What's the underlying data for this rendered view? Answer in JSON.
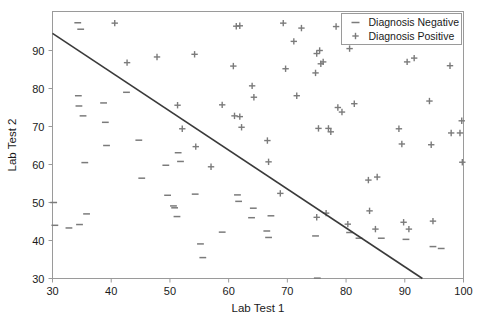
{
  "chart_data": {
    "type": "scatter",
    "title": "",
    "xlabel": "Lab Test 1",
    "ylabel": "Lab Test 2",
    "xlim": [
      30,
      100
    ],
    "ylim": [
      30,
      97
    ],
    "xticks": [
      30,
      40,
      50,
      60,
      70,
      80,
      90,
      100
    ],
    "yticks": [
      30,
      40,
      50,
      60,
      70,
      80,
      90
    ],
    "grid": false,
    "legend_position": "upper right",
    "colors": {
      "negative_marker": "#7b7b7b",
      "positive_marker": "#7b7b7b",
      "boundary_line": "#3a3a3a",
      "axis": "#9a9a9a",
      "background": "#ffffff"
    },
    "series": [
      {
        "name": "Diagnosis Negative",
        "marker": "_",
        "points": [
          [
            30.2,
            50.0
          ],
          [
            30.4,
            44.0
          ],
          [
            32.8,
            43.3
          ],
          [
            34.3,
            97.3
          ],
          [
            34.4,
            78.1
          ],
          [
            34.5,
            75.4
          ],
          [
            34.6,
            44.2
          ],
          [
            34.8,
            95.6
          ],
          [
            35.2,
            72.8
          ],
          [
            35.5,
            60.5
          ],
          [
            35.8,
            47.0
          ],
          [
            38.7,
            76.2
          ],
          [
            39.0,
            71.1
          ],
          [
            39.2,
            65.0
          ],
          [
            42.6,
            79.0
          ],
          [
            44.7,
            66.4
          ],
          [
            45.2,
            56.4
          ],
          [
            49.3,
            59.8
          ],
          [
            49.6,
            51.9
          ],
          [
            50.6,
            49.1
          ],
          [
            50.8,
            48.6
          ],
          [
            51.2,
            46.3
          ],
          [
            51.4,
            63.1
          ],
          [
            51.8,
            60.8
          ],
          [
            54.3,
            52.2
          ],
          [
            55.2,
            39.1
          ],
          [
            55.6,
            35.5
          ],
          [
            58.9,
            42.2
          ],
          [
            61.5,
            52.0
          ],
          [
            61.7,
            50.3
          ],
          [
            63.9,
            46.0
          ],
          [
            64.2,
            48.5
          ],
          [
            66.5,
            42.5
          ],
          [
            66.8,
            40.8
          ],
          [
            67.2,
            46.5
          ],
          [
            74.8,
            41.2
          ],
          [
            75.1,
            30.1
          ],
          [
            80.6,
            42.1
          ],
          [
            82.2,
            40.6
          ],
          [
            94.8,
            38.4
          ],
          [
            96.2,
            37.9
          ],
          [
            90.2,
            40.3
          ],
          [
            86.0,
            40.6
          ]
        ]
      },
      {
        "name": "Diagnosis Positive",
        "marker": "+",
        "points": [
          [
            40.6,
            97.2
          ],
          [
            42.7,
            86.8
          ],
          [
            47.8,
            88.3
          ],
          [
            51.3,
            75.6
          ],
          [
            52.1,
            69.4
          ],
          [
            54.2,
            89.0
          ],
          [
            54.4,
            64.7
          ],
          [
            57.0,
            59.4
          ],
          [
            58.9,
            75.7
          ],
          [
            60.8,
            85.9
          ],
          [
            61.0,
            72.8
          ],
          [
            61.3,
            96.4
          ],
          [
            61.9,
            96.5
          ],
          [
            61.9,
            72.6
          ],
          [
            62.2,
            69.8
          ],
          [
            64.0,
            80.7
          ],
          [
            64.3,
            77.7
          ],
          [
            66.6,
            66.3
          ],
          [
            66.8,
            60.7
          ],
          [
            68.8,
            52.4
          ],
          [
            69.3,
            97.2
          ],
          [
            69.7,
            85.2
          ],
          [
            71.1,
            92.4
          ],
          [
            71.6,
            78.1
          ],
          [
            72.4,
            95.9
          ],
          [
            74.8,
            84.1
          ],
          [
            75.0,
            89.2
          ],
          [
            75.3,
            69.5
          ],
          [
            75.5,
            90.0
          ],
          [
            75.7,
            86.5
          ],
          [
            76.1,
            87.0
          ],
          [
            75.0,
            46.1
          ],
          [
            76.6,
            47.2
          ],
          [
            77.0,
            69.5
          ],
          [
            77.4,
            68.6
          ],
          [
            78.3,
            96.3
          ],
          [
            78.6,
            75.0
          ],
          [
            79.3,
            73.8
          ],
          [
            80.3,
            44.3
          ],
          [
            80.6,
            90.5
          ],
          [
            81.4,
            76.0
          ],
          [
            83.8,
            55.9
          ],
          [
            84.0,
            47.8
          ],
          [
            85.3,
            56.7
          ],
          [
            85.0,
            43.0
          ],
          [
            89.0,
            69.4
          ],
          [
            89.5,
            65.4
          ],
          [
            89.8,
            44.8
          ],
          [
            90.4,
            87.0
          ],
          [
            90.7,
            43.0
          ],
          [
            91.6,
            88.0
          ],
          [
            94.2,
            76.7
          ],
          [
            94.5,
            65.2
          ],
          [
            94.8,
            45.1
          ],
          [
            97.7,
            86.0
          ],
          [
            97.9,
            68.3
          ],
          [
            99.4,
            68.3
          ],
          [
            99.7,
            71.5
          ],
          [
            99.8,
            60.6
          ]
        ]
      }
    ],
    "decision_boundary": {
      "x1": 30,
      "y1": 94.5,
      "x2": 93.0,
      "y2": 30
    }
  },
  "legend": {
    "entries": [
      {
        "label": "Diagnosis Negative",
        "marker": "_"
      },
      {
        "label": "Diagnosis Positive",
        "marker": "+"
      }
    ]
  },
  "axes": {
    "x_title": "Lab Test 1",
    "y_title": "Lab Test 2",
    "x_tick_labels": [
      "30",
      "40",
      "50",
      "60",
      "70",
      "80",
      "90",
      "100"
    ],
    "y_tick_labels": [
      "30",
      "40",
      "50",
      "60",
      "70",
      "80",
      "90"
    ]
  }
}
